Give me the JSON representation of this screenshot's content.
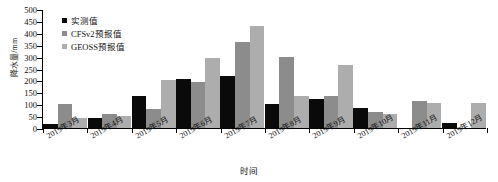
{
  "chart_data": {
    "type": "bar",
    "title": "",
    "xlabel": "时间",
    "ylabel": "降水量/mm",
    "ylim": [
      0,
      500
    ],
    "ytick_step": 50,
    "yticks": [
      0,
      50,
      100,
      150,
      200,
      250,
      300,
      350,
      400,
      450,
      500
    ],
    "grid": false,
    "legend_position": "top-left",
    "categories": [
      "2019年3月",
      "2019年4月",
      "2019年5月",
      "2019年6月",
      "2019年7月",
      "2019年8月",
      "2019年9月",
      "2019年10月",
      "2019年11月",
      "2019年12月"
    ],
    "series": [
      {
        "name": "实测值",
        "color": "#0a0a0a",
        "values": [
          18,
          43,
          133,
          205,
          220,
          103,
          123,
          82,
          0,
          20
        ]
      },
      {
        "name": "CFSv2预报值",
        "color": "#8c8c8c",
        "values": [
          100,
          58,
          80,
          192,
          360,
          298,
          136,
          68,
          113,
          0
        ]
      },
      {
        "name": "GEOSS预报值",
        "color": "#adadad",
        "values": [
          40,
          50,
          203,
          295,
          428,
          133,
          265,
          57,
          107,
          105
        ]
      }
    ]
  }
}
